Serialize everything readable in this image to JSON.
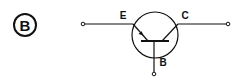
{
  "figure": {
    "option_label": "B",
    "component": "PNP transistor",
    "terminals": {
      "emitter": "E",
      "collector": "C",
      "base": "B"
    },
    "colors": {
      "stroke": "#111111",
      "background": "#ffffff"
    }
  }
}
